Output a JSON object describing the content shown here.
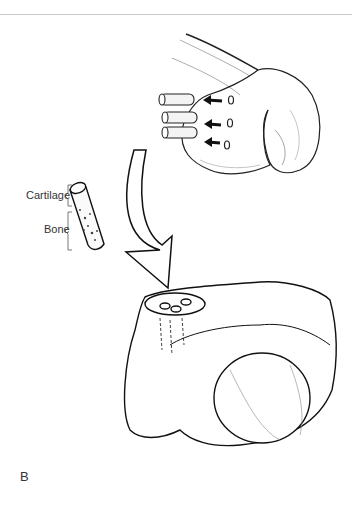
{
  "figure": {
    "panel_label": "B",
    "labels": {
      "cartilage": "Cartilage",
      "bone": "Bone"
    },
    "elements": {
      "donor_site": "femoral condyle with harvest holes",
      "plugs_count": 3,
      "graft_plug": "osteochondral cylinder",
      "recipient_site": "talus with implanted plugs",
      "transfer_arrow": "curved arrow"
    }
  }
}
